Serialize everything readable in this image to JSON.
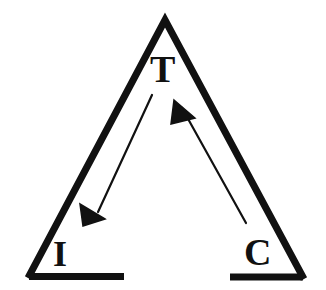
{
  "figure": {
    "type": "triangle-diagram",
    "background_color": "#ffffff",
    "stroke_color": "#111111",
    "canvas": {
      "width": 326,
      "height": 290
    },
    "triangle": {
      "apex": {
        "x": 165,
        "y": 20
      },
      "bottom_left": {
        "x": 28,
        "y": 278
      },
      "bottom_right": {
        "x": 304,
        "y": 279
      },
      "stroke_width": 7,
      "base_gap": {
        "start_x": 124,
        "end_x": 230
      },
      "base_segments": [
        {
          "x1": 30,
          "y1": 276,
          "x2": 124,
          "y2": 276
        },
        {
          "x1": 230,
          "y1": 277,
          "x2": 302,
          "y2": 277
        }
      ]
    },
    "vertices": [
      {
        "name": "top",
        "label": "T",
        "x": 165,
        "y": 70
      },
      {
        "name": "bottom-left",
        "label": "I",
        "x": 62,
        "y": 256
      },
      {
        "name": "bottom-right",
        "label": "C",
        "x": 258,
        "y": 254
      }
    ],
    "arrows": [
      {
        "name": "t-to-i",
        "label": "",
        "from": "T",
        "to": "I",
        "direction": "down-left",
        "tail": {
          "x": 152,
          "y": 95
        },
        "tip": {
          "x": 104,
          "y": 219
        },
        "shaft_width": 2,
        "head": "solid-triangle"
      },
      {
        "name": "c-to-t",
        "label": "",
        "from": "C",
        "to": "T",
        "direction": "up-left",
        "tail": {
          "x": 246,
          "y": 223
        },
        "tip": {
          "x": 176,
          "y": 100
        },
        "shaft_width": 2,
        "head": "solid-triangle"
      }
    ]
  }
}
